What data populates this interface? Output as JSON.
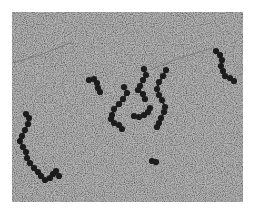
{
  "image": {
    "kind": "electron-micrograph",
    "subject": "beads-on-a-string chromatin fibers",
    "colors": {
      "border": "#ffffff",
      "background": "#b4b4b4",
      "bead": "#1c1c1c",
      "fiber": "#6e6e6e"
    },
    "field": {
      "x": 12,
      "y": 12,
      "width": 231,
      "height": 190
    },
    "fibers": [
      {
        "points": [
          [
            12,
            63
          ],
          [
            40,
            55
          ],
          [
            72,
            42
          ]
        ]
      },
      {
        "points": [
          [
            150,
            70
          ],
          [
            180,
            58
          ],
          [
            212,
            48
          ]
        ]
      }
    ],
    "bead_chains": [
      {
        "name": "chain-top-right",
        "beads": [
          [
            216,
            51
          ],
          [
            220,
            55
          ],
          [
            222,
            60
          ],
          [
            221,
            66
          ],
          [
            223,
            71
          ],
          [
            225,
            76
          ],
          [
            230,
            78
          ],
          [
            234,
            81
          ]
        ]
      },
      {
        "name": "chain-upper-left",
        "beads": [
          [
            89,
            80
          ],
          [
            94,
            79
          ],
          [
            97,
            83
          ],
          [
            98,
            88
          ],
          [
            100,
            92
          ]
        ]
      },
      {
        "name": "chain-center-arc-left",
        "beads": [
          [
            124,
            87
          ],
          [
            127,
            93
          ],
          [
            123,
            99
          ],
          [
            119,
            104
          ],
          [
            114,
            109
          ],
          [
            112,
            115
          ],
          [
            111,
            119
          ],
          [
            114,
            123
          ],
          [
            119,
            125
          ],
          [
            122,
            129
          ]
        ]
      },
      {
        "name": "chain-center-top",
        "beads": [
          [
            144,
            69
          ],
          [
            146,
            75
          ],
          [
            143,
            80
          ],
          [
            140,
            86
          ],
          [
            138,
            90
          ],
          [
            143,
            94
          ],
          [
            145,
            99
          ]
        ]
      },
      {
        "name": "chain-center-bottom",
        "beads": [
          [
            134,
            116
          ],
          [
            139,
            117
          ],
          [
            144,
            115
          ],
          [
            148,
            112
          ],
          [
            150,
            108
          ]
        ]
      },
      {
        "name": "chain-center-right",
        "beads": [
          [
            166,
            70
          ],
          [
            163,
            76
          ],
          [
            159,
            82
          ],
          [
            157,
            89
          ],
          [
            159,
            95
          ],
          [
            162,
            100
          ],
          [
            165,
            107
          ],
          [
            164,
            112
          ],
          [
            161,
            118
          ],
          [
            159,
            123
          ],
          [
            157,
            127
          ]
        ]
      },
      {
        "name": "chain-left-long",
        "beads": [
          [
            26,
            114
          ],
          [
            29,
            118
          ],
          [
            28,
            124
          ],
          [
            25,
            130
          ],
          [
            22,
            136
          ],
          [
            20,
            141
          ],
          [
            23,
            147
          ],
          [
            26,
            152
          ],
          [
            27,
            158
          ],
          [
            30,
            163
          ],
          [
            34,
            168
          ],
          [
            38,
            172
          ],
          [
            41,
            176
          ],
          [
            45,
            180
          ],
          [
            50,
            178
          ],
          [
            53,
            174
          ],
          [
            56,
            171
          ],
          [
            59,
            176
          ]
        ]
      },
      {
        "name": "isolated-bead",
        "beads": [
          [
            152,
            161
          ],
          [
            156,
            162
          ]
        ]
      }
    ]
  }
}
